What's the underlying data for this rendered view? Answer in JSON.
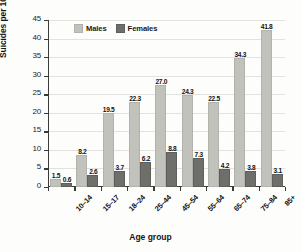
{
  "chart_data": {
    "type": "bar",
    "title": "",
    "xlabel": "Age group",
    "ylabel": "Suicides per 100,000",
    "ylim": [
      0,
      45
    ],
    "ytick_step": 5,
    "yticks": [
      "45",
      "40",
      "35",
      "30",
      "25",
      "20",
      "15",
      "10",
      "5",
      "0"
    ],
    "grid": true,
    "legend_position": "top-left-inside",
    "categories": [
      "10–14",
      "15–17",
      "18–24",
      "25–44",
      "45–54",
      "55–64",
      "65–74",
      "75–84",
      "85+"
    ],
    "series": [
      {
        "name": "Males",
        "color": "#c2c2bd",
        "values": [
          1.5,
          8.2,
          19.5,
          22.3,
          27.0,
          24.3,
          22.5,
          34.3,
          41.8
        ],
        "labels": [
          "1.5",
          "8.2",
          "19.5",
          "22.3",
          "27.0",
          "24.3",
          "22.5",
          "34.3",
          "41.8"
        ]
      },
      {
        "name": "Females",
        "color": "#6e6e6b",
        "values": [
          0.6,
          2.6,
          3.7,
          6.2,
          8.8,
          7.3,
          4.2,
          3.8,
          3.1
        ],
        "labels": [
          "0.6",
          "2.6",
          "3.7",
          "6.2",
          "8.8",
          "7.3",
          "4.2",
          "3.8",
          "3.1"
        ]
      }
    ]
  },
  "legend": {
    "males_label": "Males",
    "females_label": "Females"
  },
  "axes": {
    "y_title": "Suicides per 100,000",
    "x_title": "Age group"
  }
}
